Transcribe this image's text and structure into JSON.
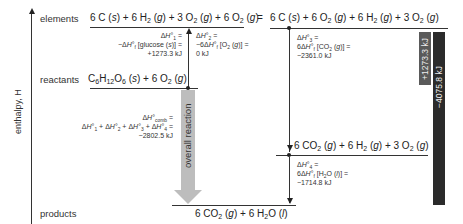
{
  "axis": {
    "label": "enthalpy, H"
  },
  "levels": {
    "elements": {
      "label": "elements",
      "left_equation": "6 C (s) + 6 H₂ (g) + 3 O₂ (g) + 6 O₂ (g)",
      "equals": "=",
      "right_equation": "6 C (s) + 6 O₂ (g) + 6 H₂ (g) + 3 O₂ (g)"
    },
    "reactants": {
      "label": "reactants",
      "equation": "C₆H₁₂O₆ (s) + 6 O₂ (g)"
    },
    "intermediate": {
      "equation": "6 CO₂ (g) + 6 H₂ (g) + 3 O₂ (g)"
    },
    "products": {
      "label": "products",
      "equation": "6 CO₂ (g) + 6 H₂O (l)"
    }
  },
  "steps": {
    "dH1": {
      "line1": "ΔH°₁ =",
      "line2": "−ΔH°f [glucose (s)] =",
      "line3": "+1273.3 kJ"
    },
    "dH2": {
      "line1": "ΔH°₂ =",
      "line2": "−6ΔH°f [O₂ (g)] =",
      "line3": "0 kJ"
    },
    "dH3": {
      "line1": "ΔH°₃ =",
      "line2": "6ΔH°f [CO₂ (g)] =",
      "line3": "−2361.0 kJ"
    },
    "dH4": {
      "line1": "ΔH°₄ =",
      "line2": "6ΔH°f [H₂O (l)] =",
      "line3": "−1714.8 kJ"
    },
    "comb": {
      "line1": "ΔH°comb =",
      "line2": "ΔH°₁ + ΔH°₂ + ΔH°₃ + ΔH°₄ =",
      "line3": "−2802.5 kJ"
    }
  },
  "overall_arrow": {
    "label": "overall reaction"
  },
  "bars": {
    "up": {
      "label": "+1273.3 kJ",
      "color": "#5a5a5a"
    },
    "down": {
      "label": "−4075.8 kJ",
      "color": "#2b2b2b"
    }
  },
  "colors": {
    "arrow_gray": "#bdbdbd",
    "line": "#333333"
  }
}
